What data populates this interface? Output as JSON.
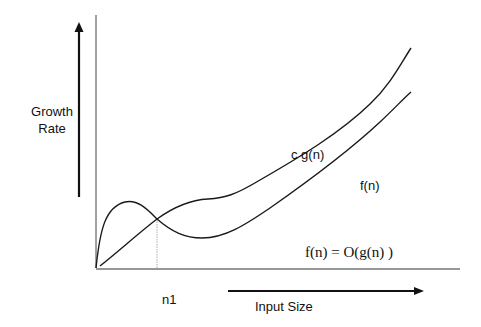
{
  "diagram": {
    "y_axis_label": "Growth Rate",
    "x_axis_label": "Input Size",
    "threshold_label": "n1",
    "curves": [
      {
        "name": "c g(n)",
        "label": "c g(n)",
        "description": "upper bound curve, starts near origin, rises with a plateau then grows steeply"
      },
      {
        "name": "f(n)",
        "label": "f(n)",
        "description": "function curve, early hump above c g(n), dips below after n1, then grows"
      }
    ],
    "relation": "f(n) = O(g(n) )",
    "colors": {
      "line": "#1a1a1a",
      "axis": "#333333",
      "threshold": "#999999",
      "background": "#ffffff"
    }
  }
}
